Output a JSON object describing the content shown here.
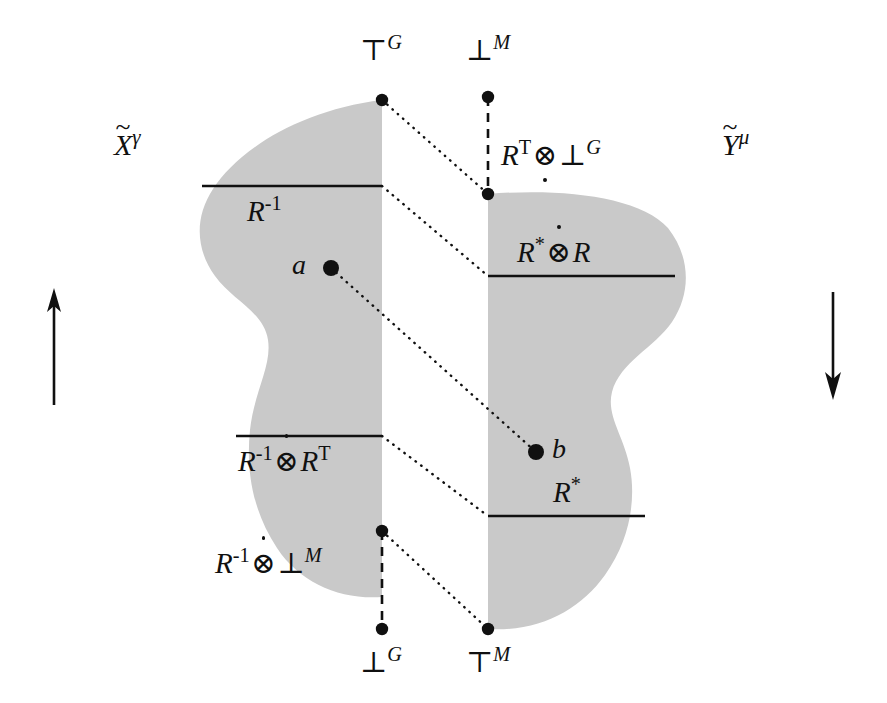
{
  "figure": {
    "kind": "mathematical-diagram",
    "colors": {
      "blob_fill": "#c9c9c9",
      "stroke": "#101010",
      "background": "#ffffff"
    }
  },
  "axis_labels": {
    "left_domain": {
      "base": "X",
      "accent": "~",
      "superscript": "γ"
    },
    "right_domain": {
      "base": "Y",
      "accent": "~",
      "superscript": "μ"
    }
  },
  "corner_labels": {
    "top_left": {
      "symbol": "⊤",
      "superscript": "G"
    },
    "top_right": {
      "symbol": "⊥",
      "superscript": "M"
    },
    "bottom_left": {
      "symbol": "⊥",
      "superscript": "G"
    },
    "bottom_right": {
      "symbol": "⊤",
      "superscript": "M"
    }
  },
  "region_labels": {
    "left_upper": {
      "text": "R",
      "superscript": "-1"
    },
    "left_lower": {
      "left_base": "R",
      "left_sup": "-1",
      "operator": "⊗",
      "operator_dot": "above",
      "right_base": "R",
      "right_sup": "T"
    },
    "left_outside": {
      "left_base": "R",
      "left_sup": "-1",
      "operator": "⊗",
      "operator_dot": "above",
      "right_base": "⊥",
      "right_sup": "M"
    },
    "right_outside": {
      "left_base": "R",
      "left_sup": "T",
      "operator": "⊗",
      "operator_dot": "below",
      "right_base": "⊥",
      "right_sup": "G"
    },
    "right_upper": {
      "left_base": "R",
      "left_sup": "*",
      "operator": "⊗",
      "operator_dot": "above",
      "right_base": "R",
      "right_sup": ""
    },
    "right_lower": {
      "text": "R",
      "superscript": "*"
    }
  },
  "points": {
    "a": {
      "label": "a",
      "x": 331,
      "y": 268
    },
    "b": {
      "label": "b",
      "x": 536,
      "y": 452
    }
  },
  "arrows": {
    "left": {
      "direction": "up",
      "name": "up-arrow"
    },
    "right": {
      "direction": "down",
      "name": "down-arrow"
    }
  }
}
